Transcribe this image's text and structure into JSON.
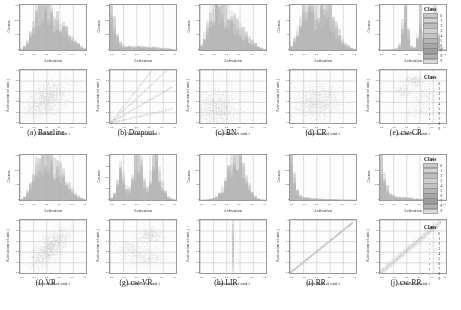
{
  "figure": {
    "panel_count": 10,
    "hist_ylabel": "Counts",
    "hist_xlabel": "Activation",
    "scatter_ylabel": "Activation of unit j",
    "scatter_xlabel": "Activation of unit i",
    "legend_title": "Class",
    "class_labels": [
      "0",
      "1",
      "2",
      "3",
      "4",
      "5",
      "6",
      "7",
      "8",
      "9"
    ],
    "class_colors": [
      "#c9c9c9",
      "#d4d4d4",
      "#bdbdbd",
      "#cfcfcf",
      "#c4c4c4",
      "#b5b5b5",
      "#a8a8a8",
      "#9d9d9d",
      "#b0b0b0",
      "#dadada"
    ]
  },
  "chart_data": [
    {
      "id": "a",
      "caption": "(a) Baseline",
      "type": "histogram+scatter",
      "hist": {
        "type": "bar",
        "title": "",
        "xlabel": "Activation",
        "ylabel": "Counts",
        "xlim": [
          0.0,
          1.0
        ],
        "ylim": [
          0,
          320
        ],
        "xticks": [
          "0.0",
          "0.2",
          "0.4",
          "0.6",
          "0.8",
          "1.0"
        ],
        "yticks": [
          "300",
          "200",
          "100",
          "0"
        ],
        "mode": "broad-unimodal",
        "peak_x": 0.42,
        "spread": 0.2,
        "values": [
          8,
          22,
          55,
          105,
          170,
          235,
          280,
          300,
          295,
          270,
          240,
          215,
          190,
          165,
          140,
          118,
          95,
          72,
          52,
          34,
          20,
          10
        ]
      },
      "scatter": {
        "type": "scatter",
        "xlabel": "Activation of unit i",
        "ylabel": "Activation of unit j",
        "xlim": [
          0.0,
          1.0
        ],
        "ylim": [
          0.0,
          1.0
        ],
        "xticks": [
          "0.0",
          "0.2",
          "0.4",
          "0.6",
          "0.8",
          "1.0"
        ],
        "yticks": [
          "1.0",
          "0.8",
          "0.6",
          "0.4",
          "0.2",
          "0.0"
        ],
        "pattern": "diffuse-blob",
        "correlation": 0.45,
        "n_points": 2600,
        "cx": 0.4,
        "cy": 0.45,
        "sx": 0.17,
        "sy": 0.19
      }
    },
    {
      "id": "b",
      "caption": "(b) Dropout",
      "type": "histogram+scatter",
      "hist": {
        "type": "bar",
        "xlabel": "Activation",
        "ylabel": "Counts",
        "xlim": [
          0.0,
          1.0
        ],
        "ylim": [
          0,
          700
        ],
        "xticks": [
          "0.0",
          "0.2",
          "0.4",
          "0.6",
          "0.8",
          "1.0"
        ],
        "yticks": [
          "600",
          "400",
          "200",
          "0"
        ],
        "mode": "spike-at-zero",
        "peak_x": 0.06,
        "spread": 0.05,
        "values": [
          690,
          420,
          180,
          95,
          70,
          62,
          58,
          55,
          52,
          50,
          48,
          46,
          44,
          42,
          40,
          38,
          34,
          30,
          26,
          20,
          14,
          8
        ]
      },
      "scatter": {
        "type": "scatter",
        "xlabel": "Activation of unit i",
        "ylabel": "Activation of unit j",
        "xlim": [
          0.0,
          1.0
        ],
        "ylim": [
          0.0,
          1.0
        ],
        "xticks": [
          "0.0",
          "0.2",
          "0.4",
          "0.6",
          "0.8",
          "1.0"
        ],
        "yticks": [
          "1.0",
          "0.8",
          "0.6",
          "0.4",
          "0.2",
          "0.0"
        ],
        "pattern": "linear-rays",
        "ray_slopes": [
          1.55,
          1.15,
          0.72,
          0.28
        ],
        "correlation": 0.97,
        "n_points": 2200
      }
    },
    {
      "id": "c",
      "caption": "(c) BN",
      "type": "histogram+scatter",
      "hist": {
        "type": "bar",
        "xlabel": "Activation",
        "ylabel": "Counts",
        "xlim": [
          0.0,
          1.0
        ],
        "ylim": [
          0,
          300
        ],
        "xticks": [
          "0.0",
          "0.2",
          "0.4",
          "0.6",
          "0.8",
          "1.0"
        ],
        "yticks": [
          "250",
          "150",
          "50",
          "0"
        ],
        "mode": "broad-unimodal",
        "peak_x": 0.34,
        "spread": 0.2,
        "values": [
          30,
          85,
          150,
          215,
          265,
          290,
          285,
          268,
          245,
          222,
          200,
          178,
          155,
          132,
          110,
          88,
          68,
          50,
          34,
          20,
          11,
          5
        ]
      },
      "scatter": {
        "type": "scatter",
        "xlabel": "Activation of unit i",
        "ylabel": "Activation of unit j",
        "xlim": [
          0.0,
          1.0
        ],
        "ylim": [
          0.0,
          1.0
        ],
        "xticks": [
          "0.0",
          "0.2",
          "0.4",
          "0.6",
          "0.8",
          "1.0"
        ],
        "yticks": [
          "1.0",
          "0.8",
          "0.6",
          "0.4",
          "0.2",
          "0.0"
        ],
        "pattern": "diffuse-corner",
        "correlation": 0.05,
        "n_points": 2600,
        "cx": 0.24,
        "cy": 0.26,
        "sx": 0.2,
        "sy": 0.21
      }
    },
    {
      "id": "d",
      "caption": "(d) CR",
      "type": "histogram+scatter",
      "hist": {
        "type": "bar",
        "xlabel": "Activation",
        "ylabel": "Counts",
        "xlim": [
          0.0,
          1.0
        ],
        "ylim": [
          0,
          300
        ],
        "xticks": [
          "0.0",
          "0.2",
          "0.4",
          "0.6",
          "0.8",
          "1.0"
        ],
        "yticks": [
          "250",
          "150",
          "50",
          "0"
        ],
        "mode": "broad-bimodal",
        "peak_x": 0.45,
        "spread": 0.22,
        "values": [
          20,
          60,
          120,
          185,
          240,
          268,
          255,
          230,
          215,
          228,
          250,
          262,
          240,
          205,
          168,
          130,
          95,
          66,
          42,
          24,
          12,
          5
        ]
      },
      "scatter": {
        "type": "scatter",
        "xlabel": "Activation of unit i",
        "ylabel": "Activation of unit j",
        "xlim": [
          0.0,
          1.0
        ],
        "ylim": [
          0.0,
          1.0
        ],
        "xticks": [
          "0.0",
          "0.2",
          "0.4",
          "0.6",
          "0.8",
          "1.0"
        ],
        "yticks": [
          "1.0",
          "0.8",
          "0.6",
          "0.4",
          "0.2",
          "0.0"
        ],
        "pattern": "diffuse-blob",
        "correlation": 0.12,
        "n_points": 2400,
        "cx": 0.42,
        "cy": 0.4,
        "sx": 0.19,
        "sy": 0.18
      }
    },
    {
      "id": "e",
      "caption": "(e) cw-CR",
      "type": "histogram+scatter",
      "hist": {
        "type": "bar",
        "xlabel": "Activation",
        "ylabel": "Counts",
        "xlim": [
          0.0,
          1.0
        ],
        "ylim": [
          0,
          600
        ],
        "xticks": [
          "0.0",
          "0.2",
          "0.4",
          "0.6",
          "0.8",
          "1.0"
        ],
        "yticks": [
          "500",
          "300",
          "100",
          "0"
        ],
        "mode": "sharp-multimodal",
        "peaks_x": [
          0.46,
          0.62,
          0.8
        ],
        "spread": 0.03,
        "values": [
          4,
          6,
          8,
          10,
          14,
          20,
          60,
          330,
          560,
          210,
          48,
          30,
          150,
          480,
          180,
          40,
          26,
          120,
          430,
          160,
          30,
          8
        ]
      },
      "scatter": {
        "type": "scatter",
        "xlabel": "Activation of unit i",
        "ylabel": "Activation of unit j",
        "xlim": [
          0.0,
          1.0
        ],
        "ylim": [
          0.0,
          1.0
        ],
        "xticks": [
          "0.0",
          "0.2",
          "0.4",
          "0.6",
          "0.8",
          "1.0"
        ],
        "yticks": [
          "1.0",
          "0.8",
          "0.6",
          "0.4",
          "0.2",
          "0.0"
        ],
        "pattern": "clustered",
        "correlation": 0.1,
        "n_points": 1500,
        "clusters": [
          {
            "cx": 0.52,
            "cy": 0.8,
            "sx": 0.07,
            "sy": 0.06
          },
          {
            "cx": 0.34,
            "cy": 0.6,
            "sx": 0.08,
            "sy": 0.07
          },
          {
            "cx": 0.66,
            "cy": 0.52,
            "sx": 0.1,
            "sy": 0.12
          },
          {
            "cx": 0.6,
            "cy": 0.22,
            "sx": 0.12,
            "sy": 0.1
          }
        ]
      }
    },
    {
      "id": "f",
      "caption": "(f) VR",
      "type": "histogram+scatter",
      "hist": {
        "type": "bar",
        "xlabel": "Activation",
        "ylabel": "Counts",
        "xlim": [
          0.0,
          1.0
        ],
        "ylim": [
          0,
          320
        ],
        "xticks": [
          "0.0",
          "0.2",
          "0.4",
          "0.6",
          "0.8",
          "1.0"
        ],
        "yticks": [
          "300",
          "200",
          "100",
          "0"
        ],
        "mode": "broad-unimodal",
        "peak_x": 0.48,
        "spread": 0.21,
        "values": [
          6,
          18,
          48,
          95,
          155,
          215,
          265,
          295,
          305,
          298,
          280,
          255,
          225,
          195,
          160,
          128,
          96,
          68,
          44,
          26,
          13,
          5
        ]
      },
      "scatter": {
        "type": "scatter",
        "xlabel": "Activation of unit i",
        "ylabel": "Activation of unit j",
        "xlim": [
          0.0,
          1.0
        ],
        "ylim": [
          0.0,
          1.0
        ],
        "xticks": [
          "0.0",
          "0.2",
          "0.4",
          "0.6",
          "0.8",
          "1.0"
        ],
        "yticks": [
          "1.0",
          "0.8",
          "0.6",
          "0.4",
          "0.2",
          "0.0"
        ],
        "pattern": "elongated-blob",
        "correlation": 0.72,
        "n_points": 2600,
        "cx": 0.46,
        "cy": 0.48,
        "sx": 0.16,
        "sy": 0.2
      }
    },
    {
      "id": "g",
      "caption": "(g) cw-VR",
      "type": "histogram+scatter",
      "hist": {
        "type": "bar",
        "xlabel": "Activation",
        "ylabel": "Counts",
        "xlim": [
          0.0,
          1.0
        ],
        "ylim": [
          0,
          420
        ],
        "xticks": [
          "0.0",
          "0.2",
          "0.4",
          "0.6",
          "0.8",
          "1.0"
        ],
        "yticks": [
          "400",
          "300",
          "200",
          "100",
          "0"
        ],
        "mode": "multimodal",
        "peaks_x": [
          0.26,
          0.5,
          0.72
        ],
        "spread": 0.06,
        "values": [
          20,
          60,
          150,
          260,
          200,
          110,
          90,
          180,
          330,
          400,
          300,
          150,
          110,
          200,
          340,
          380,
          260,
          140,
          70,
          30,
          12,
          4
        ]
      },
      "scatter": {
        "type": "scatter",
        "xlabel": "Activation of unit i",
        "ylabel": "Activation of unit j",
        "xlim": [
          0.0,
          1.0
        ],
        "ylim": [
          0.0,
          1.0
        ],
        "xticks": [
          "0.0",
          "0.2",
          "0.4",
          "0.6",
          "0.8",
          "1.0"
        ],
        "yticks": [
          "1.0",
          "0.8",
          "0.6",
          "0.4",
          "0.2",
          "0.0"
        ],
        "pattern": "clustered",
        "correlation": 0.2,
        "n_points": 2000,
        "clusters": [
          {
            "cx": 0.62,
            "cy": 0.72,
            "sx": 0.1,
            "sy": 0.08
          },
          {
            "cx": 0.3,
            "cy": 0.45,
            "sx": 0.11,
            "sy": 0.12
          },
          {
            "cx": 0.58,
            "cy": 0.28,
            "sx": 0.13,
            "sy": 0.1
          }
        ]
      }
    },
    {
      "id": "h",
      "caption": "(h) LIR",
      "type": "histogram+scatter",
      "hist": {
        "type": "bar",
        "xlabel": "Activation",
        "ylabel": "Counts",
        "xlim": [
          0.0,
          1.0
        ],
        "ylim": [
          0,
          340
        ],
        "xticks": [
          "0.0",
          "0.2",
          "0.4",
          "0.6",
          "0.8",
          "1.0"
        ],
        "yticks": [
          "300",
          "200",
          "100",
          "0"
        ],
        "mode": "narrow-unimodal",
        "peak_x": 0.56,
        "spread": 0.1,
        "values": [
          2,
          3,
          5,
          8,
          14,
          24,
          42,
          72,
          120,
          190,
          265,
          320,
          330,
          290,
          220,
          150,
          92,
          50,
          24,
          10,
          4,
          2
        ]
      },
      "scatter": {
        "type": "scatter",
        "xlabel": "Activation of unit i",
        "ylabel": "Activation of unit j",
        "xlim": [
          0.0,
          1.0
        ],
        "ylim": [
          0.0,
          1.0
        ],
        "xticks": [
          "0.0",
          "0.2",
          "0.4",
          "0.6",
          "0.8",
          "1.0"
        ],
        "yticks": [
          "1.0",
          "0.8",
          "0.6",
          "0.4",
          "0.2",
          "0.0"
        ],
        "pattern": "vertical-line",
        "correlation": 0.0,
        "n_points": 1800,
        "cx": 0.5,
        "cy": 0.5,
        "sx": 0.006,
        "sy": 0.3
      }
    },
    {
      "id": "i",
      "caption": "(i) RR",
      "type": "histogram+scatter",
      "hist": {
        "type": "bar",
        "xlabel": "Activation",
        "ylabel": "Counts",
        "xlim": [
          0.0,
          1.0
        ],
        "ylim": [
          0,
          750
        ],
        "xticks": [
          "0.0",
          "0.2",
          "0.4",
          "0.6",
          "0.8",
          "1.0"
        ],
        "yticks": [
          "600",
          "400",
          "200",
          "0"
        ],
        "mode": "spike-at-zero",
        "peak_x": 0.04,
        "spread": 0.04,
        "values": [
          740,
          380,
          150,
          80,
          55,
          42,
          35,
          30,
          26,
          23,
          20,
          18,
          16,
          14,
          12,
          10,
          9,
          7,
          6,
          5,
          3,
          2
        ]
      },
      "scatter": {
        "type": "scatter",
        "xlabel": "Activation of unit i",
        "ylabel": "Activation of unit j",
        "xlim": [
          0.0,
          1.0
        ],
        "ylim": [
          0.0,
          1.0
        ],
        "xticks": [
          "0.0",
          "0.2",
          "0.4",
          "0.6",
          "0.8",
          "1.0"
        ],
        "yticks": [
          "1.0",
          "0.8",
          "0.6",
          "0.4",
          "0.2",
          "0.0"
        ],
        "pattern": "tight-diagonal",
        "correlation": 0.995,
        "n_points": 2200,
        "slope": 1.0
      }
    },
    {
      "id": "j",
      "caption": "(j) cw-RR",
      "type": "histogram+scatter",
      "hist": {
        "type": "bar",
        "xlabel": "Activation",
        "ylabel": "Counts",
        "xlim": [
          0.0,
          1.0
        ],
        "ylim": [
          0,
          700
        ],
        "xticks": [
          "0.0",
          "0.2",
          "0.4",
          "0.6",
          "0.8",
          "1.0"
        ],
        "yticks": [
          "600",
          "400",
          "200",
          "0"
        ],
        "mode": "spike-at-zero",
        "peak_x": 0.05,
        "spread": 0.05,
        "values": [
          680,
          400,
          175,
          92,
          64,
          50,
          43,
          38,
          34,
          30,
          27,
          24,
          21,
          18,
          15,
          13,
          11,
          9,
          7,
          5,
          3,
          2
        ]
      },
      "scatter": {
        "type": "scatter",
        "xlabel": "Activation of unit i",
        "ylabel": "Activation of unit j",
        "xlim": [
          0.0,
          1.0
        ],
        "ylim": [
          0.0,
          1.0
        ],
        "xticks": [
          "0.0",
          "0.2",
          "0.4",
          "0.6",
          "0.8",
          "1.0"
        ],
        "yticks": [
          "1.0",
          "0.8",
          "0.6",
          "0.4",
          "0.2",
          "0.0"
        ],
        "pattern": "broad-diagonal",
        "correlation": 0.96,
        "n_points": 2400,
        "slope": 1.05
      }
    }
  ]
}
